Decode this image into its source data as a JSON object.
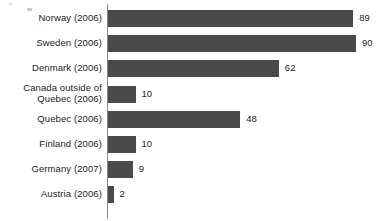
{
  "chart_data": {
    "type": "bar",
    "orientation": "horizontal",
    "title": "",
    "subtitle": "",
    "xlabel": "",
    "ylabel": "",
    "xlim": [
      0,
      90
    ],
    "ylim": null,
    "grid": false,
    "legend": null,
    "legend_position": "none",
    "bar_color": "#4a4a4a",
    "text_color": "#1c1c1c",
    "axis_color": "#8a8a8a",
    "background": "#ffffff",
    "value_labels": true,
    "categories": [
      "Norway (2006)",
      "Sweden (2006)",
      "Denmark (2006)",
      "Canada outside of Quebec (2006)",
      "Quebec (2006)",
      "Finland (2006)",
      "Germany (2007)",
      "Austria (2006)"
    ],
    "values": [
      89,
      90,
      62,
      10,
      48,
      10,
      9,
      2
    ],
    "points": [
      {
        "category": "Norway (2006)",
        "label_lines": [
          "Norway (2006)"
        ],
        "value": 89,
        "value_text": "89"
      },
      {
        "category": "Sweden (2006)",
        "label_lines": [
          "Sweden (2006)"
        ],
        "value": 90,
        "value_text": "90"
      },
      {
        "category": "Denmark (2006)",
        "label_lines": [
          "Denmark (2006)"
        ],
        "value": 62,
        "value_text": "62"
      },
      {
        "category": "Canada outside of Quebec (2006)",
        "label_lines": [
          "Canada outside of",
          "Quebec (2006)"
        ],
        "value": 10,
        "value_text": "10"
      },
      {
        "category": "Quebec (2006)",
        "label_lines": [
          "Quebec (2006)"
        ],
        "value": 48,
        "value_text": "48"
      },
      {
        "category": "Finland (2006)",
        "label_lines": [
          "Finland (2006)"
        ],
        "value": 10,
        "value_text": "10"
      },
      {
        "category": "Germany (2007)",
        "label_lines": [
          "Germany (2007)"
        ],
        "value": 9,
        "value_text": "9"
      },
      {
        "category": "Austria (2006)",
        "label_lines": [
          "Austria (2006)"
        ],
        "value": 2,
        "value_text": "2"
      }
    ]
  }
}
